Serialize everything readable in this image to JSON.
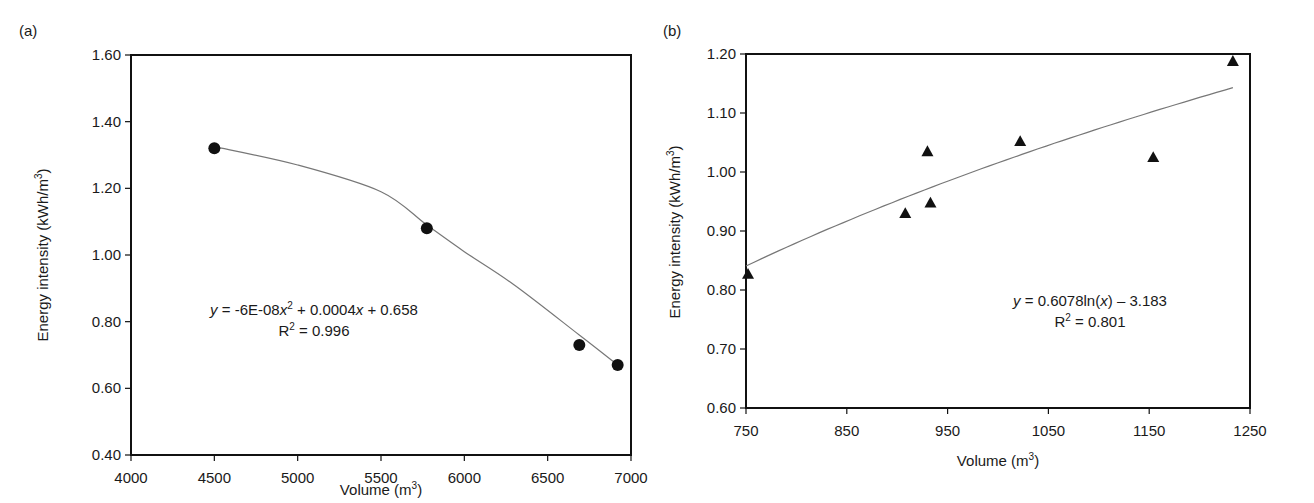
{
  "figure": {
    "panels": [
      {
        "label": "(a)",
        "ylabel": "Energy intensity (kWh/m",
        "ylabel_sup": "3",
        "ylabel_close": ")",
        "xlabel": "Volume (m",
        "xlabel_sup": "3",
        "xlabel_close": ")",
        "equation_y": "y",
        "equation_rest_1": " = -6E-08",
        "equation_x1": "x",
        "equation_sup": "2",
        "equation_rest_2": " + 0.0004",
        "equation_x2": "x",
        "equation_rest_3": " + 0.658",
        "r2_label": "R",
        "r2_sup": "2",
        "r2_value": " = 0.996"
      },
      {
        "label": "(b)",
        "ylabel": "Energy intensity (kWh/m",
        "ylabel_sup": "3",
        "ylabel_close": ")",
        "xlabel": "Volume (m",
        "xlabel_sup": "3",
        "xlabel_close": ")",
        "equation_y": "y",
        "equation_rest_1": " = 0.6078ln(",
        "equation_x1": "x",
        "equation_rest_2": ") – 3.183",
        "r2_label": "R",
        "r2_sup": "2",
        "r2_value": " = 0.801"
      }
    ]
  },
  "chart_data": [
    {
      "type": "scatter",
      "panel": "(a)",
      "title": "",
      "xlabel": "Volume (m3)",
      "ylabel": "Energy intensity (kWh/m3)",
      "xlim": [
        4000,
        7000
      ],
      "ylim": [
        0.4,
        1.6
      ],
      "x_ticks": [
        "4000",
        "4500",
        "5000",
        "5500",
        "6000",
        "6500",
        "7000"
      ],
      "y_ticks": [
        "0.40",
        "0.60",
        "0.80",
        "1.00",
        "1.20",
        "1.40",
        "1.60"
      ],
      "grid": false,
      "legend": "none",
      "marker": "circle",
      "series": [
        {
          "name": "data",
          "x": [
            4500,
            5775,
            6690,
            6920
          ],
          "y": [
            1.32,
            1.08,
            0.73,
            0.67
          ]
        }
      ],
      "trendline": {
        "kind": "polynomial-2",
        "equation": "y = -6E-08x^2 + 0.0004x + 0.658",
        "r2": 0.996,
        "x_range": [
          4500,
          6920
        ],
        "points": [
          [
            4500,
            1.325
          ],
          [
            5000,
            1.27
          ],
          [
            5500,
            1.19
          ],
          [
            5775,
            1.09
          ],
          [
            6000,
            1.01
          ],
          [
            6300,
            0.91
          ],
          [
            6690,
            0.76
          ],
          [
            6920,
            0.67
          ]
        ]
      }
    },
    {
      "type": "scatter",
      "panel": "(b)",
      "title": "",
      "xlabel": "Volume (m3)",
      "ylabel": "Energy intensity (kWh/m3)",
      "xlim": [
        750,
        1250
      ],
      "ylim": [
        0.6,
        1.2
      ],
      "x_ticks": [
        "750",
        "850",
        "950",
        "1050",
        "1150",
        "1250"
      ],
      "y_ticks": [
        "0.60",
        "0.70",
        "0.80",
        "0.90",
        "1.00",
        "1.10",
        "1.20"
      ],
      "grid": false,
      "legend": "none",
      "marker": "triangle",
      "series": [
        {
          "name": "data",
          "x": [
            752,
            908,
            930,
            933,
            1022,
            1154,
            1233
          ],
          "y": [
            0.827,
            0.93,
            1.035,
            0.948,
            1.052,
            1.025,
            1.188
          ]
        }
      ],
      "trendline": {
        "kind": "logarithmic",
        "equation": "y = 0.6078ln(x) - 3.183",
        "r2": 0.801,
        "x_range": [
          750,
          1233
        ]
      }
    }
  ]
}
